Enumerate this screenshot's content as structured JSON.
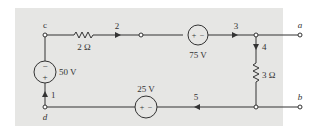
{
  "diagram": {
    "type": "circuit",
    "background_color": "#e6e6e4",
    "line_color": "#333333",
    "nodes": {
      "c": "c",
      "d": "d",
      "a": "a",
      "b": "b"
    },
    "components": {
      "resistor_top": {
        "label": "2 Ω"
      },
      "resistor_right": {
        "label": "3 Ω"
      },
      "source_left": {
        "label": "50 V",
        "top_sign": "−",
        "bottom_sign": "+"
      },
      "source_top": {
        "label": "75 V",
        "left_sign": "+",
        "right_sign": "−"
      },
      "source_bottom": {
        "label": "25 V",
        "left_sign": "+",
        "right_sign": "−"
      }
    },
    "branch_labels": {
      "b1": "1",
      "b2": "2",
      "b3": "3",
      "b4": "4",
      "b5": "5"
    }
  }
}
